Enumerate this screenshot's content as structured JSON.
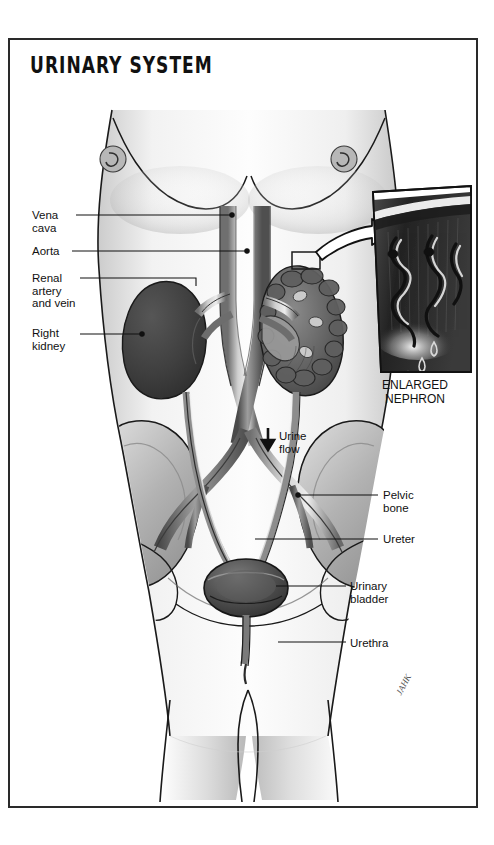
{
  "figure": {
    "title": "URINARY SYSTEM",
    "signature": "JAHK"
  },
  "labels_left": [
    {
      "id": "vena-cava",
      "text": "Vena\ncava",
      "x": 32,
      "y": 209,
      "leader_x1": 76,
      "leader_y1": 215,
      "leader_x2": 232,
      "leader_y2": 215
    },
    {
      "id": "aorta",
      "text": "Aorta",
      "x": 32,
      "y": 245,
      "leader_x1": 72,
      "leader_y1": 251,
      "leader_x2": 247,
      "leader_y2": 251
    },
    {
      "id": "renal",
      "text": "Renal\nartery\nand vein",
      "x": 32,
      "y": 272,
      "leader_x1": 80,
      "leader_y1": 278,
      "leader_x2": 196,
      "leader_y2": 278
    },
    {
      "id": "right-kidney",
      "text": "Right\nkidney",
      "x": 32,
      "y": 327,
      "leader_x1": 80,
      "leader_y1": 334,
      "leader_x2": 142,
      "leader_y2": 334
    }
  ],
  "labels_right": [
    {
      "id": "pelvic-bone",
      "text": "Pelvic\nbone",
      "x": 383,
      "y": 489,
      "leader_x1": 378,
      "leader_y1": 495,
      "leader_x2": 298,
      "leader_y2": 495
    },
    {
      "id": "ureter",
      "text": "Ureter",
      "x": 383,
      "y": 533,
      "leader_x1": 378,
      "leader_y1": 539,
      "leader_x2": 255,
      "leader_y2": 539
    },
    {
      "id": "urinary-bladder",
      "text": "Urinary\nbladder",
      "x": 350,
      "y": 580,
      "leader_x1": 346,
      "leader_y1": 586,
      "leader_x2": 276,
      "leader_y2": 586
    },
    {
      "id": "urethra",
      "text": "Urethra",
      "x": 350,
      "y": 637,
      "leader_x1": 346,
      "leader_y1": 642,
      "leader_x2": 278,
      "leader_y2": 642
    }
  ],
  "annotations": {
    "urine_flow": {
      "text": "Urine\nflow",
      "x": 279,
      "y": 437,
      "arrow_x": 268,
      "arrow_y": 438
    },
    "inset_caption": {
      "text": "ENLARGED\nNEPHRON",
      "x": 378,
      "y": 382
    }
  },
  "colors": {
    "ink": "#1a1a1a",
    "frame": "#2a2a2a",
    "skin_light": "#fbfbfb",
    "skin_shade": "#c9c9c9",
    "skin_mid": "#dedede",
    "kidney_dark": "#3d3d3d",
    "kidney_solid": "#4a4a4a",
    "vessel_gray": "#8e8e8e",
    "vessel_dark": "#595959",
    "bone_gray": "#b4b4b4",
    "bone_shade": "#9a9a9a",
    "inset_dark": "#2e2e2e",
    "inset_darker": "#1f1f1f",
    "bladder": "#4f4f4f"
  }
}
